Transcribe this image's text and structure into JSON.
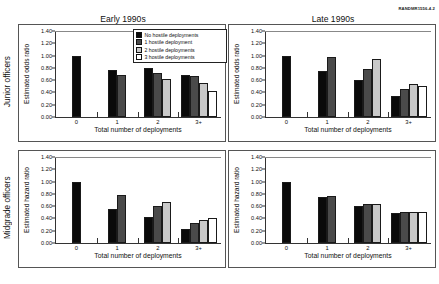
{
  "figure_id": "RANDMR1556-4.2",
  "row_labels": [
    {
      "name": "junior",
      "label": "Junior officers"
    },
    {
      "name": "midgrade",
      "label": "Midgrade officers"
    }
  ],
  "column_titles": [
    {
      "name": "early",
      "label": "Early 1990s"
    },
    {
      "name": "late",
      "label": "Late 1990s"
    }
  ],
  "legend": {
    "items": [
      {
        "label": "No hostile deployments",
        "color": "#0a0a0a"
      },
      {
        "label": "1 hostile deployment",
        "color": "#4a4a4a"
      },
      {
        "label": "2 hostile deployments",
        "color": "#c9c9c9"
      },
      {
        "label": "3 hostile deployments",
        "color": "#ffffff"
      }
    ]
  },
  "axis": {
    "yticks": [
      "0.00",
      "0.20",
      "0.40",
      "0.60",
      "0.80",
      "1.00",
      "1.20",
      "1.40"
    ],
    "ylim": [
      0,
      1.4
    ],
    "xticks": [
      "0",
      "1",
      "2",
      "3+"
    ],
    "xlabel": "Total number of deployments",
    "ylabel_odds": "Estimated odds ratio",
    "ylabel_hazard": "Estimated hazard ratio"
  },
  "chart_data": [
    {
      "type": "bar",
      "panel": "top-left",
      "title": "Early 1990s",
      "row": "Junior officers",
      "xlabel": "Total number of deployments",
      "ylabel": "Estimated odds ratio",
      "ylim": [
        0,
        1.4
      ],
      "grid": false,
      "legend_position": "top-right",
      "categories": [
        "0",
        "1",
        "2",
        "3+"
      ],
      "series": [
        {
          "name": "No hostile deployments",
          "values": [
            1.0,
            0.77,
            0.8,
            0.69
          ]
        },
        {
          "name": "1 hostile deployment",
          "values": [
            null,
            0.69,
            0.72,
            0.66
          ]
        },
        {
          "name": "2 hostile deployments",
          "values": [
            null,
            null,
            0.62,
            0.55
          ]
        },
        {
          "name": "3 hostile deployments",
          "values": [
            null,
            null,
            null,
            0.43
          ]
        }
      ]
    },
    {
      "type": "bar",
      "panel": "top-right",
      "title": "Late 1990s",
      "row": "Junior officers",
      "xlabel": "Total number of deployments",
      "ylabel": "Estimated odds ratio",
      "ylim": [
        0,
        1.4
      ],
      "grid": false,
      "legend_position": "none",
      "categories": [
        "0",
        "1",
        "2",
        "3+"
      ],
      "series": [
        {
          "name": "No hostile deployments",
          "values": [
            1.0,
            0.75,
            0.61,
            0.35
          ]
        },
        {
          "name": "1 hostile deployment",
          "values": [
            null,
            0.97,
            0.78,
            0.45
          ]
        },
        {
          "name": "2 hostile deployments",
          "values": [
            null,
            null,
            0.94,
            0.54
          ]
        },
        {
          "name": "3 hostile deployments",
          "values": [
            null,
            null,
            null,
            0.5
          ]
        }
      ]
    },
    {
      "type": "bar",
      "panel": "bottom-left",
      "title": "Early 1990s",
      "row": "Midgrade officers",
      "xlabel": "Total number of deployments",
      "ylabel": "Estimated hazard ratio",
      "ylim": [
        0,
        1.4
      ],
      "grid": false,
      "legend_position": "none",
      "categories": [
        "0",
        "1",
        "2",
        "3+"
      ],
      "series": [
        {
          "name": "No hostile deployments",
          "values": [
            1.0,
            0.56,
            0.43,
            0.23
          ]
        },
        {
          "name": "1 hostile deployment",
          "values": [
            null,
            0.78,
            0.6,
            0.33
          ]
        },
        {
          "name": "2 hostile deployments",
          "values": [
            null,
            null,
            0.67,
            0.37
          ]
        },
        {
          "name": "3 hostile deployments",
          "values": [
            null,
            null,
            null,
            0.41
          ]
        }
      ]
    },
    {
      "type": "bar",
      "panel": "bottom-right",
      "title": "Late 1990s",
      "row": "Midgrade officers",
      "xlabel": "Total number of deployments",
      "ylabel": "Estimated hazard ratio",
      "ylim": [
        0,
        1.4
      ],
      "grid": false,
      "legend_position": "none",
      "categories": [
        "0",
        "1",
        "2",
        "3+"
      ],
      "series": [
        {
          "name": "No hostile deployments",
          "values": [
            1.0,
            0.75,
            0.61,
            0.49
          ]
        },
        {
          "name": "1 hostile deployment",
          "values": [
            null,
            0.77,
            0.63,
            0.51
          ]
        },
        {
          "name": "2 hostile deployments",
          "values": [
            null,
            null,
            0.64,
            0.51
          ]
        },
        {
          "name": "3 hostile deployments",
          "values": [
            null,
            null,
            null,
            0.51
          ]
        }
      ]
    }
  ]
}
